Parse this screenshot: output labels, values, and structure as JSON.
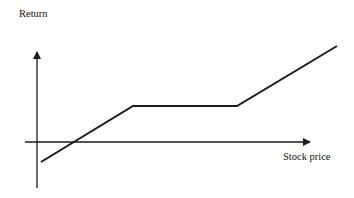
{
  "chart_data": {
    "type": "line",
    "title": "",
    "xlabel": "Stock price",
    "ylabel": "Return",
    "grid": false,
    "legend": null,
    "axes": {
      "origin_px": [
        37,
        142
      ],
      "x_axis": {
        "from_px": [
          25,
          142
        ],
        "to_px": [
          312,
          142
        ],
        "arrow": true
      },
      "y_axis": {
        "from_px": [
          37,
          188
        ],
        "to_px": [
          37,
          50
        ],
        "arrow": true
      }
    },
    "series": [
      {
        "name": "payoff",
        "points_px": [
          [
            41,
            162
          ],
          [
            133,
            106
          ],
          [
            237,
            106
          ],
          [
            337,
            46
          ]
        ],
        "description": "Negative return at low stock price, rising linearly, then flat (capped) region, then rising again"
      }
    ],
    "tick_labels": {
      "x": [],
      "y": []
    }
  },
  "labels": {
    "y_axis": "Return",
    "x_axis": "Stock price"
  },
  "colors": {
    "line": "#1a1a1a",
    "axis": "#1a1a1a",
    "background": "#ffffff"
  }
}
